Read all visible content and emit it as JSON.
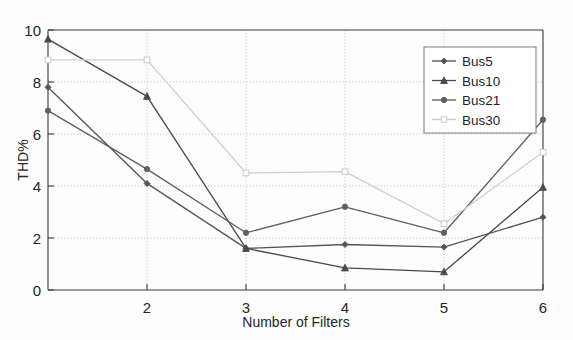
{
  "chart_data": {
    "type": "line",
    "title": "",
    "xlabel": "Number of Filters",
    "ylabel": "THD%",
    "x": [
      1,
      2,
      3,
      4,
      5,
      6
    ],
    "xlim": [
      1,
      6
    ],
    "ylim": [
      0,
      10
    ],
    "xticks": [
      2,
      3,
      4,
      5,
      6
    ],
    "xticklabels": [
      "2",
      "3",
      "4",
      "5",
      "6"
    ],
    "yticks": [
      0,
      2,
      4,
      6,
      8,
      10
    ],
    "yticklabels": [
      "0",
      "2",
      "4",
      "6",
      "8",
      "10"
    ],
    "grid": true,
    "grid_axis": "y",
    "legend_position": "upper right",
    "series": [
      {
        "name": "Bus5",
        "values": [
          7.8,
          4.1,
          1.6,
          1.75,
          1.65,
          2.8
        ],
        "color": "#555555",
        "marker": "diamond"
      },
      {
        "name": "Bus10",
        "values": [
          9.65,
          7.45,
          1.6,
          0.85,
          0.7,
          3.95
        ],
        "color": "#4a4a4a",
        "marker": "triangle"
      },
      {
        "name": "Bus21",
        "values": [
          6.9,
          4.65,
          2.2,
          3.2,
          2.2,
          6.55
        ],
        "color": "#606060",
        "marker": "circle"
      },
      {
        "name": "Bus30",
        "values": [
          8.85,
          8.85,
          4.5,
          4.55,
          2.55,
          5.3
        ],
        "color": "#cfcfcf",
        "marker": "square"
      }
    ]
  },
  "axis": {
    "y_label": "THD%",
    "x_label": "Number of Filters",
    "y_tick_0": "0",
    "y_tick_1": "2",
    "y_tick_2": "4",
    "y_tick_3": "6",
    "y_tick_4": "8",
    "y_tick_5": "10",
    "x_tick_0": "2",
    "x_tick_1": "3",
    "x_tick_2": "4",
    "x_tick_3": "5",
    "x_tick_4": "6"
  },
  "legend": {
    "entries": [
      {
        "label": "Bus5"
      },
      {
        "label": "Bus10"
      },
      {
        "label": "Bus21"
      },
      {
        "label": "Bus30"
      }
    ]
  }
}
